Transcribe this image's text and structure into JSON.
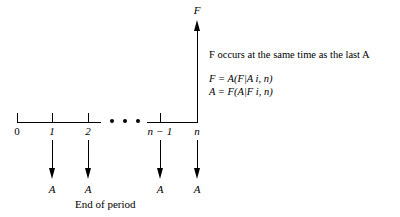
{
  "figure": {
    "type": "cash-flow-timeline-diagram",
    "axis_label": "End of period",
    "future_value_label": "F",
    "annuity_label": "A",
    "ellipsis": "• • •",
    "timeline": {
      "ticks": [
        {
          "label": "0",
          "italic": false,
          "x": 17,
          "has_arrow": false
        },
        {
          "label": "1",
          "italic": true,
          "x": 52,
          "has_arrow": true
        },
        {
          "label": "2",
          "italic": true,
          "x": 88,
          "has_arrow": true
        },
        {
          "label": "n − 1",
          "italic": true,
          "x": 160,
          "has_arrow": true
        },
        {
          "label": "n",
          "italic": true,
          "x": 197,
          "has_arrow": true
        }
      ]
    },
    "annotations": {
      "statement": "F occurs at the same time as the last A",
      "formula_f": "F = A(F|A i, n)",
      "formula_a": "A = F(A|F i, n)"
    },
    "colors": {
      "ink": "#000000",
      "background": "#ffffff"
    }
  }
}
